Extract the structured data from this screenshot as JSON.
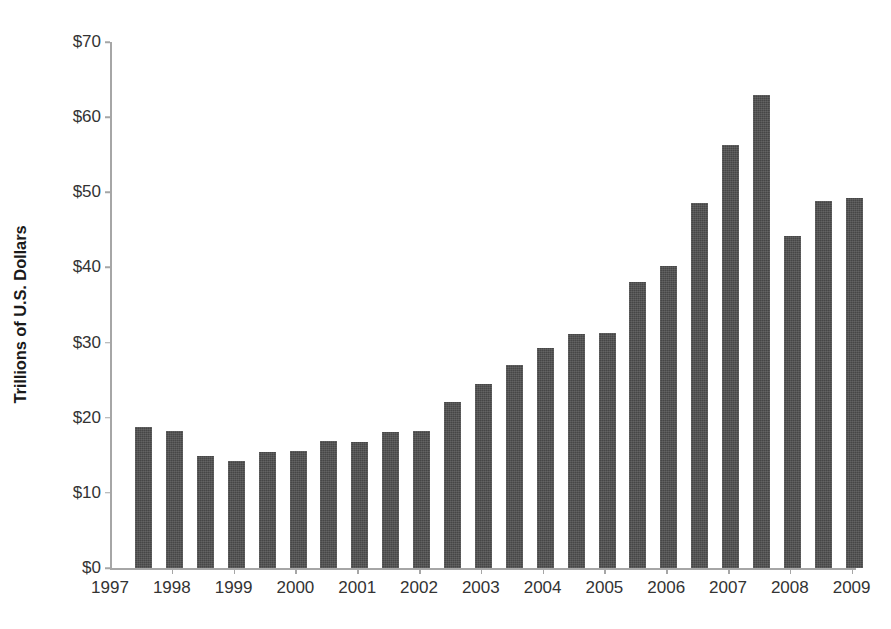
{
  "chart_data": {
    "type": "bar",
    "title": "",
    "subtitle": "",
    "xlabel": "",
    "ylabel": "Trillions of U.S. Dollars",
    "ylim": [
      0,
      70
    ],
    "y_ticks": [
      0,
      10,
      20,
      30,
      40,
      50,
      60,
      70
    ],
    "y_tick_labels": [
      "$0",
      "$10",
      "$20",
      "$30",
      "$40",
      "$50",
      "$60",
      "$70"
    ],
    "x_tick_labels": [
      "1997",
      "1998",
      "1999",
      "2000",
      "2001",
      "2002",
      "2003",
      "2004",
      "2005",
      "2006",
      "2007",
      "2008",
      "2009"
    ],
    "grid": false,
    "legend": "none",
    "bar_color": "#4d4d4d",
    "axis_color": "#a6a6a6",
    "text_color": "#333333",
    "background": "#ffffff",
    "categories": [
      "1997 H1",
      "1997 H2",
      "1998 H1",
      "1998 H2",
      "1999 H1",
      "1999 H2",
      "2000 H1",
      "2000 H2",
      "2001 H1",
      "2001 H2",
      "2002 H1",
      "2002 H2",
      "2003 H1",
      "2003 H2",
      "2004 H1",
      "2004 H2",
      "2005 H1",
      "2005 H2",
      "2006 H1",
      "2006 H2",
      "2007 H1",
      "2007 H2",
      "2008 H1",
      "2008 H2"
    ],
    "values": [
      18.8,
      18.2,
      14.9,
      14.3,
      15.5,
      15.6,
      16.9,
      16.8,
      18.1,
      18.3,
      22.1,
      24.5,
      27.0,
      29.3,
      31.1,
      31.3,
      38.1,
      40.2,
      48.6,
      56.3,
      63.0,
      44.2,
      48.9,
      49.3
    ]
  }
}
